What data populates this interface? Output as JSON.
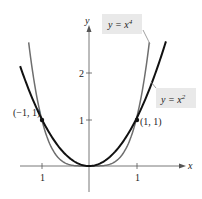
{
  "chart_data": {
    "type": "line",
    "title": "",
    "xlabel": "x",
    "ylabel": "y",
    "xlim": [
      -1.9,
      1.7
    ],
    "ylim": [
      -0.3,
      3.4
    ],
    "grid": false,
    "x_ticks": [
      {
        "value": -1,
        "label": "1"
      },
      {
        "value": 1,
        "label": "1"
      }
    ],
    "y_ticks": [
      {
        "value": 1,
        "label": "1"
      },
      {
        "value": 2,
        "label": "2"
      }
    ],
    "series": [
      {
        "name": "y = x^4",
        "label": "y = x",
        "exponent": "4",
        "color": "#6e6e6e",
        "function": "x^4",
        "x_range": [
          -1.27,
          1.27
        ]
      },
      {
        "name": "y = x^2",
        "label": "y = x",
        "exponent": "2",
        "color": "#111111",
        "function": "x^2",
        "x_range": [
          -1.45,
          1.62
        ]
      }
    ],
    "points": [
      {
        "x": -1,
        "y": 1,
        "label": "(−1, 1)"
      },
      {
        "x": 1,
        "y": 1,
        "label": "(1, 1)"
      }
    ],
    "annotations": [
      {
        "text": "y = x^4",
        "target": "x^4 curve"
      },
      {
        "text": "y = x^2",
        "target": "x^2 curve"
      }
    ]
  }
}
